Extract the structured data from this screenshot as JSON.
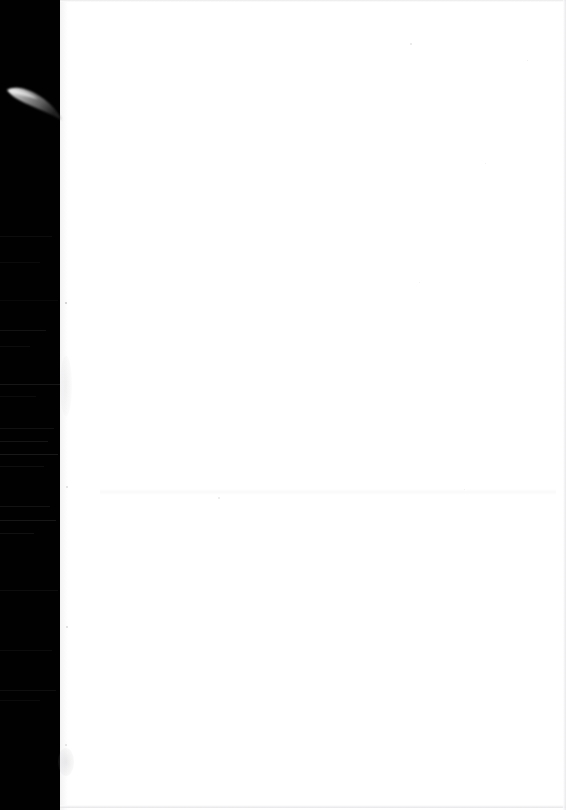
{
  "document": {
    "kind": "scanned-page",
    "content_text": "",
    "page_state": "blank",
    "width_px": 566,
    "height_px": 810
  },
  "colors": {
    "scanner_bed": "#010101",
    "paper": "#ffffff",
    "paper_edge_shadow": "#e4e4e7",
    "streak": "#2a2a2a",
    "speck": "#b9b9bd",
    "wedge_light": "#d8d8d8"
  },
  "regions": {
    "scanner_bed": {
      "label": "scanner-bed-margin",
      "x": 0,
      "y": 0,
      "width": 64,
      "height": 810
    },
    "paper_sheet": {
      "label": "paper-sheet",
      "x": 60,
      "y": 0,
      "width": 506,
      "height": 810
    }
  },
  "artifacts": {
    "wedge": {
      "label": "curved-light-wedge",
      "x": 6,
      "y": 84,
      "width": 56,
      "height": 34
    },
    "streaks": [
      {
        "y": 236,
        "width": 52,
        "opacity": 0.3
      },
      {
        "y": 262,
        "width": 40,
        "opacity": 0.25
      },
      {
        "y": 300,
        "width": 58,
        "opacity": 0.22
      },
      {
        "y": 330,
        "width": 46,
        "opacity": 0.45
      },
      {
        "y": 346,
        "width": 30,
        "opacity": 0.3
      },
      {
        "y": 384,
        "width": 60,
        "opacity": 0.55
      },
      {
        "y": 396,
        "width": 36,
        "opacity": 0.28
      },
      {
        "y": 428,
        "width": 54,
        "opacity": 0.4
      },
      {
        "y": 441,
        "width": 48,
        "opacity": 0.5
      },
      {
        "y": 454,
        "width": 58,
        "opacity": 0.6
      },
      {
        "y": 466,
        "width": 44,
        "opacity": 0.35
      },
      {
        "y": 506,
        "width": 50,
        "opacity": 0.45
      },
      {
        "y": 520,
        "width": 56,
        "opacity": 0.55
      },
      {
        "y": 533,
        "width": 34,
        "opacity": 0.4
      },
      {
        "y": 590,
        "width": 58,
        "opacity": 0.3
      },
      {
        "y": 650,
        "width": 52,
        "opacity": 0.28
      },
      {
        "y": 690,
        "width": 56,
        "opacity": 0.35
      },
      {
        "y": 700,
        "width": 40,
        "opacity": 0.25
      }
    ],
    "specks": [
      {
        "x": 65,
        "y": 302,
        "size": 2.0,
        "opacity": 0.75
      },
      {
        "x": 66,
        "y": 486,
        "size": 1.6,
        "opacity": 0.45
      },
      {
        "x": 66,
        "y": 626,
        "size": 1.8,
        "opacity": 0.5
      },
      {
        "x": 65,
        "y": 744,
        "size": 1.6,
        "opacity": 0.4
      },
      {
        "x": 410,
        "y": 43,
        "size": 1.6,
        "opacity": 0.35
      },
      {
        "x": 527,
        "y": 60,
        "size": 1.4,
        "opacity": 0.3
      },
      {
        "x": 419,
        "y": 282,
        "size": 1.4,
        "opacity": 0.25
      },
      {
        "x": 485,
        "y": 163,
        "size": 1.4,
        "opacity": 0.28
      },
      {
        "x": 218,
        "y": 497,
        "size": 1.6,
        "opacity": 0.3
      },
      {
        "x": 464,
        "y": 489,
        "size": 1.4,
        "opacity": 0.25
      }
    ],
    "smudges": [
      {
        "x": 58,
        "y": 748,
        "width": 16,
        "height": 28,
        "opacity": 0.45
      },
      {
        "x": 60,
        "y": 356,
        "width": 12,
        "height": 60,
        "opacity": 0.25
      }
    ],
    "noise_band": {
      "y": 489,
      "x": 100,
      "width": 456,
      "height": 6,
      "opacity": 0.55
    }
  }
}
